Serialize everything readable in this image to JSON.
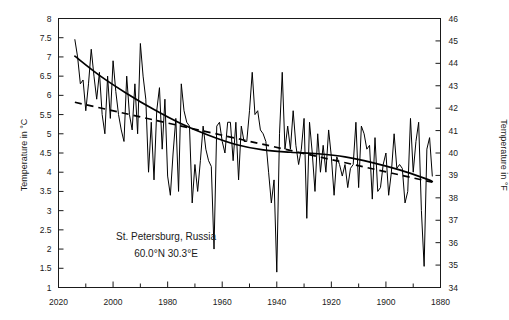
{
  "figure": {
    "annotation_line1": "St. Petersburg, Russia",
    "annotation_line2": "60.0°N  30.3°E",
    "ylabel_left": "Temperature in °C",
    "ylabel_right": "Temperature in °F"
  },
  "chart_data": {
    "type": "line",
    "title": "",
    "xlabel": "",
    "ylabel": "Temperature in °C",
    "ylabel_secondary": "Temperature in °F",
    "xlim": [
      2020,
      1880
    ],
    "x_reversed": true,
    "ylim": [
      1,
      8
    ],
    "ylim_secondary": [
      34,
      46
    ],
    "grid": false,
    "legend": "none",
    "annotations": [
      "St. Petersburg, Russia",
      "60.0°N  30.3°E"
    ],
    "xticks": [
      2020,
      2000,
      1980,
      1960,
      1940,
      1920,
      1900,
      1880
    ],
    "xticks_minor": [
      2010,
      1990,
      1970,
      1950,
      1930,
      1910,
      1890
    ],
    "yticks": [
      1,
      1.5,
      2,
      2.5,
      3,
      3.5,
      4,
      4.5,
      5,
      5.5,
      6,
      6.5,
      7,
      7.5,
      8
    ],
    "yticks_secondary": [
      34,
      35,
      36,
      37,
      38,
      39,
      40,
      41,
      42,
      43,
      44,
      45,
      46
    ],
    "series": [
      {
        "name": "Annual mean temperature",
        "style": "solid-thin",
        "x": [
          2014,
          2013,
          2012,
          2011,
          2010,
          2009,
          2008,
          2007,
          2006,
          2005,
          2004,
          2003,
          2002,
          2001,
          2000,
          1999,
          1998,
          1997,
          1996,
          1995,
          1994,
          1993,
          1992,
          1991,
          1990,
          1989,
          1988,
          1987,
          1986,
          1985,
          1984,
          1983,
          1982,
          1981,
          1980,
          1979,
          1978,
          1977,
          1976,
          1975,
          1974,
          1973,
          1972,
          1971,
          1970,
          1969,
          1968,
          1967,
          1966,
          1965,
          1964,
          1963,
          1962,
          1961,
          1960,
          1959,
          1958,
          1957,
          1956,
          1955,
          1954,
          1953,
          1952,
          1951,
          1950,
          1949,
          1948,
          1947,
          1946,
          1945,
          1944,
          1943,
          1942,
          1941,
          1940,
          1939,
          1938,
          1937,
          1936,
          1935,
          1934,
          1933,
          1932,
          1931,
          1930,
          1929,
          1928,
          1927,
          1926,
          1925,
          1924,
          1923,
          1922,
          1921,
          1920,
          1919,
          1918,
          1917,
          1916,
          1915,
          1914,
          1913,
          1912,
          1911,
          1910,
          1909,
          1908,
          1907,
          1906,
          1905,
          1904,
          1903,
          1902,
          1901,
          1900,
          1899,
          1898,
          1897,
          1896,
          1895,
          1894,
          1893,
          1892,
          1891,
          1890,
          1889,
          1888,
          1887,
          1886,
          1885,
          1884,
          1883
        ],
        "values": [
          7.45,
          7.0,
          6.3,
          6.4,
          5.6,
          6.3,
          7.2,
          6.5,
          5.9,
          6.6,
          5.5,
          5.0,
          6.5,
          5.4,
          6.9,
          6.1,
          5.5,
          5.1,
          4.8,
          6.5,
          5.5,
          5.1,
          6.3,
          5.0,
          7.35,
          6.5,
          5.9,
          4.0,
          5.3,
          3.8,
          5.6,
          6.2,
          4.6,
          5.9,
          3.9,
          3.4,
          4.5,
          5.4,
          3.5,
          6.3,
          5.6,
          5.3,
          5.2,
          3.2,
          4.2,
          3.5,
          4.3,
          5.2,
          4.6,
          4.3,
          4.15,
          2.0,
          5.2,
          5.3,
          4.8,
          4.5,
          5.3,
          5.3,
          4.3,
          5.3,
          3.8,
          5.2,
          4.8,
          4.8,
          5.6,
          6.6,
          5.5,
          5.6,
          5.1,
          5.0,
          4.8,
          4.0,
          3.2,
          3.8,
          1.4,
          5.0,
          6.6,
          4.6,
          5.2,
          4.6,
          5.6,
          4.7,
          4.2,
          4.6,
          5.4,
          2.8,
          5.3,
          4.5,
          3.5,
          5.0,
          4.0,
          4.7,
          4.0,
          5.1,
          4.4,
          3.4,
          4.4,
          4.2,
          3.9,
          4.2,
          3.6,
          4.1,
          4.2,
          5.3,
          3.6,
          5.2,
          5.0,
          4.6,
          4.7,
          3.3,
          4.9,
          3.5,
          3.6,
          4.2,
          4.5,
          3.4,
          4.0,
          5.0,
          4.1,
          4.2,
          4.1,
          3.2,
          3.5,
          5.4,
          4.0,
          4.8,
          5.3,
          3.0,
          1.55,
          4.6,
          4.9,
          3.9
        ]
      },
      {
        "name": "Smoothed trend (solid)",
        "style": "solid-thick",
        "x": [
          2014,
          2005,
          1995,
          1985,
          1975,
          1965,
          1955,
          1945,
          1935,
          1925,
          1915,
          1905,
          1895,
          1885,
          1883
        ],
        "values": [
          7.02,
          6.52,
          6.05,
          5.63,
          5.26,
          4.96,
          4.72,
          4.58,
          4.52,
          4.48,
          4.4,
          4.25,
          4.06,
          3.82,
          3.76
        ]
      },
      {
        "name": "Linear trend (dashed)",
        "style": "dashed",
        "x": [
          2014,
          1883
        ],
        "values": [
          5.82,
          3.74
        ]
      }
    ]
  }
}
